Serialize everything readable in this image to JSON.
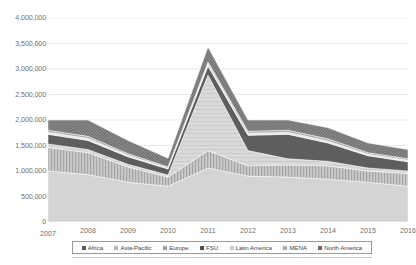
{
  "chart_data": {
    "type": "area",
    "stacked": true,
    "title": "",
    "subtitle": "",
    "xlabel": "",
    "ylabel": "",
    "categories": [
      "2007",
      "2008",
      "2009",
      "2010",
      "2011",
      "2012",
      "2013",
      "2014",
      "2015",
      "2016"
    ],
    "x": [
      2007,
      2008,
      2009,
      2010,
      2011,
      2012,
      2013,
      2014,
      2015,
      2016
    ],
    "ylim": [
      0,
      4000000
    ],
    "ytick_values": [
      0,
      500000,
      1000000,
      1500000,
      2000000,
      2500000,
      3000000,
      3500000,
      4000000
    ],
    "ytick_labels": [
      "0",
      "500,000",
      "1,000,000",
      "1,500,000",
      "2,000,000",
      "2,500,000",
      "3,000,000",
      "3,500,000",
      "4,000,000"
    ],
    "xtick_labels": [
      "2007",
      "2008",
      "2009",
      "2010",
      "2011",
      "2012",
      "2013",
      "2014",
      "2015",
      "2016"
    ],
    "grid": true,
    "grid_axis": "y",
    "legend_position": "bottom",
    "legend_entries": [
      "Africa",
      "Asia-Pacific",
      "Europe",
      "FSU",
      "Latin America",
      "MENA",
      "North America"
    ],
    "series": [
      {
        "name": "Africa",
        "color": "#d2d2d2",
        "pattern": "solid-light",
        "values": [
          1000000,
          930000,
          780000,
          700000,
          1060000,
          900000,
          880000,
          840000,
          780000,
          700000
        ]
      },
      {
        "name": "Asia-Pacific",
        "color": "#bfbfbf",
        "pattern": "vertical-stripe",
        "values": [
          460000,
          430000,
          300000,
          180000,
          340000,
          200000,
          240000,
          260000,
          220000,
          250000
        ]
      },
      {
        "name": "Europe",
        "color": "#cfcfcf",
        "pattern": "light-hatch",
        "values": [
          70000,
          60000,
          50000,
          40000,
          1480000,
          300000,
          120000,
          90000,
          60000,
          50000
        ]
      },
      {
        "name": "FSU",
        "color": "#5b5b5b",
        "pattern": "solid-dark",
        "values": [
          190000,
          180000,
          150000,
          120000,
          180000,
          300000,
          480000,
          360000,
          240000,
          180000
        ]
      },
      {
        "name": "Latin America",
        "color": "#e2e2e2",
        "pattern": "solid-pale",
        "values": [
          40000,
          40000,
          30000,
          20000,
          40000,
          40000,
          40000,
          40000,
          30000,
          30000
        ]
      },
      {
        "name": "MENA",
        "color": "#a8a8a8",
        "pattern": "diagonal",
        "values": [
          40000,
          40000,
          30000,
          20000,
          40000,
          40000,
          40000,
          40000,
          30000,
          30000
        ]
      },
      {
        "name": "North America",
        "color": "#8c8c8c",
        "pattern": "checker",
        "values": [
          200000,
          320000,
          260000,
          170000,
          290000,
          220000,
          200000,
          220000,
          190000,
          180000
        ]
      }
    ],
    "totals": [
      2000000,
      2000000,
      1600000,
      1250000,
      3430000,
      2000000,
      2000000,
      1850000,
      1550000,
      1420000
    ]
  },
  "axis": {
    "y_tick_labels": [
      "4,000,000",
      "3,500,000",
      "3,000,000",
      "2,500,000",
      "2,000,000",
      "1,500,000",
      "1,000,000",
      "500,000",
      "0"
    ],
    "x_tick_labels": [
      "2007",
      "2008",
      "2009",
      "2010",
      "2011",
      "2012",
      "2013",
      "2014",
      "2015",
      "2016"
    ]
  },
  "legend": {
    "items": [
      {
        "label": "Africa",
        "swatch": "#5a5a5a"
      },
      {
        "label": "Asia-Pacific",
        "swatch": "#b8b8b8"
      },
      {
        "label": "Europe",
        "swatch": "#a0a0a0"
      },
      {
        "label": "FSU",
        "swatch": "#4d4d4d"
      },
      {
        "label": "Latin America",
        "swatch": "#cccccc"
      },
      {
        "label": "MENA",
        "swatch": "#ababab"
      },
      {
        "label": "North America",
        "swatch": "#6b6b6b"
      }
    ]
  }
}
